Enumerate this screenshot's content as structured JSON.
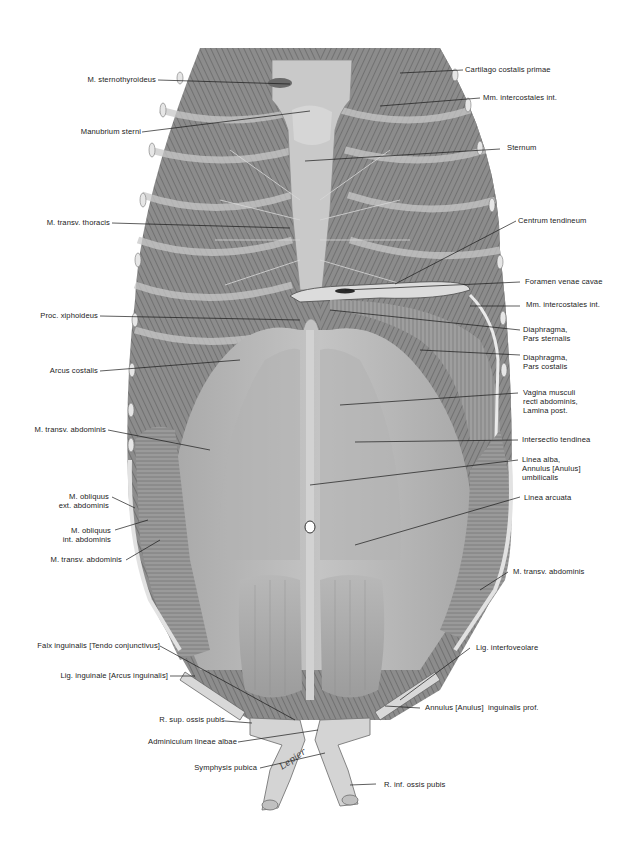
{
  "figure": {
    "artist_signature": "Lepier",
    "colors": {
      "background": "#ffffff",
      "illustration_tone": "#9a9a9a",
      "label_text": "#222222",
      "leader_line": "#1a1a1a"
    }
  },
  "labels": {
    "left": [
      {
        "id": "m-sternothyroideus",
        "text": "M. sternothyroideus"
      },
      {
        "id": "manubrium-sterni",
        "text": "Manubrium sterni"
      },
      {
        "id": "m-transv-thoracis",
        "text": "M. transv. thoracis"
      },
      {
        "id": "proc-xiphoideus",
        "text": "Proc. xiphoideus"
      },
      {
        "id": "arcus-costalis",
        "text": "Arcus costalis"
      },
      {
        "id": "m-transv-abdominis-1",
        "text": "M. transv. abdominis"
      },
      {
        "id": "m-obliquus-ext",
        "text": "M. obliquus\next. abdominis"
      },
      {
        "id": "m-obliquus-int",
        "text": "M. obliquus\nint. abdominis"
      },
      {
        "id": "m-transv-abdominis-2",
        "text": "M. transv. abdominis"
      },
      {
        "id": "falx-inguinalis",
        "text": "Falx inguinalis [Tendo conjunctivus]"
      },
      {
        "id": "lig-inguinale",
        "text": "Lig. inguinale [Arcus inguinalis]"
      },
      {
        "id": "r-sup-ossis-pubis",
        "text": "R. sup. ossis pubis"
      },
      {
        "id": "adminiculum",
        "text": "Adminiculum lineae albae"
      },
      {
        "id": "symphysis-pubica",
        "text": "Symphysis pubica"
      }
    ],
    "right": [
      {
        "id": "cartilago-costalis",
        "text": "Cartilago costalis primae"
      },
      {
        "id": "mm-intercostales-1",
        "text": "Mm. intercostales int."
      },
      {
        "id": "sternum",
        "text": "Sternum"
      },
      {
        "id": "centrum-tendineum",
        "text": "Centrum tendineum"
      },
      {
        "id": "foramen-venae-cavae",
        "text": "Foramen venae cavae"
      },
      {
        "id": "mm-intercostales-2",
        "text": "Mm. intercostales int."
      },
      {
        "id": "diaphragma-sternalis",
        "text": "Diaphragma,\nPars sternalis"
      },
      {
        "id": "diaphragma-costalis",
        "text": "Diaphragma,\nPars costalis"
      },
      {
        "id": "vagina-musculi",
        "text": "Vagina musculi\nrecti abdominis,\nLamina post."
      },
      {
        "id": "intersectio-tendinea",
        "text": "Intersectio tendinea"
      },
      {
        "id": "linea-alba",
        "text": "Linea alba,\nAnnulus [Anulus]\numbilicalis"
      },
      {
        "id": "linea-arcuata",
        "text": "Linea arcuata"
      },
      {
        "id": "m-transv-abdominis-3",
        "text": "M. transv. abdominis"
      },
      {
        "id": "lig-interfoveolare",
        "text": "Lig. interfoveolare"
      },
      {
        "id": "annulus-inguinalis",
        "text": "Annulus [Anulus]  inguinalis prof."
      },
      {
        "id": "r-inf-ossis-pubis",
        "text": "R. inf. ossis pubis"
      }
    ]
  }
}
